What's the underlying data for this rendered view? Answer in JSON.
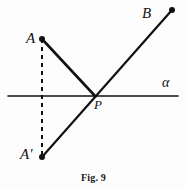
{
  "figure": {
    "caption": "Fig. 9",
    "background_color": "#fdfdfd",
    "stroke_color": "#111111",
    "labels": {
      "point_a": "A",
      "point_a_prime": "A'",
      "point_b": "B",
      "point_p": "P",
      "line_alpha": "α"
    },
    "geometry": {
      "points": {
        "A": {
          "x": 42,
          "y": 39
        },
        "A_prime": {
          "x": 42,
          "y": 157
        },
        "B": {
          "x": 172,
          "y": 10
        },
        "P": {
          "x": 95,
          "y": 96
        }
      },
      "segments": [
        {
          "name": "line-alpha",
          "from": {
            "x": 8,
            "y": 96
          },
          "to": {
            "x": 178,
            "y": 96
          },
          "style": "solid",
          "width": 1.6
        },
        {
          "name": "segment-a-to-p",
          "from": {
            "x": 42,
            "y": 39
          },
          "to": {
            "x": 95,
            "y": 96
          },
          "style": "solid",
          "width": 2.6
        },
        {
          "name": "segment-a-prime-to-b",
          "from": {
            "x": 42,
            "y": 157
          },
          "to": {
            "x": 172,
            "y": 10
          },
          "style": "solid",
          "width": 2.2
        },
        {
          "name": "segment-a-to-a-prime",
          "from": {
            "x": 42,
            "y": 39
          },
          "to": {
            "x": 42,
            "y": 157
          },
          "style": "dashed",
          "width": 2.0,
          "dash": "4,4"
        }
      ],
      "dots": [
        {
          "name": "dot-a",
          "x": 42,
          "y": 39,
          "r": 3.0
        },
        {
          "name": "dot-a-prime",
          "x": 42,
          "y": 157,
          "r": 3.0
        },
        {
          "name": "dot-b",
          "x": 172,
          "y": 10,
          "r": 3.0
        }
      ]
    }
  }
}
